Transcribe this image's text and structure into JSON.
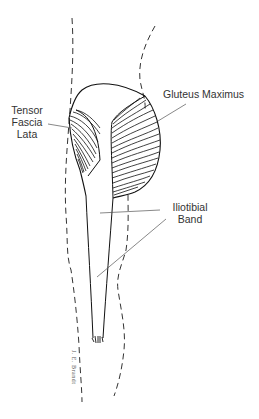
{
  "diagram": {
    "labels": {
      "tensor_fascia_lata": [
        "Tensor",
        "Fascia",
        "Lata"
      ],
      "gluteus_maximus": "Gluteus Maximus",
      "iliotibial_band": [
        "Iliotibial",
        "Band"
      ]
    },
    "signature": "J. E. Brandt",
    "colors": {
      "line": "#222222",
      "leader": "#555555",
      "background": "#ffffff"
    }
  }
}
